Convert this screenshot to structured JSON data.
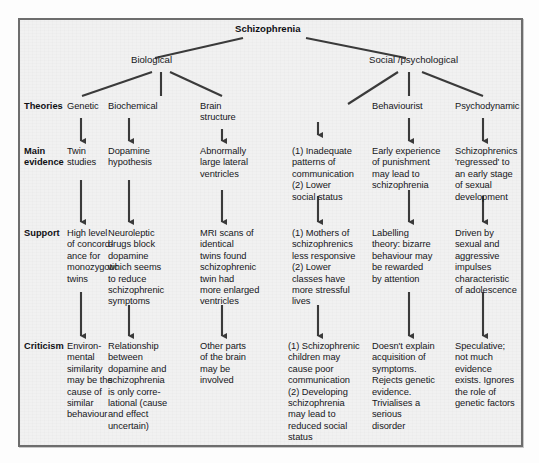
{
  "figure": {
    "root": "Schizophrenia",
    "branches": [
      {
        "id": "biological",
        "label": "Biological"
      },
      {
        "id": "social",
        "label": "Social /psychological"
      }
    ],
    "row_labels": [
      {
        "id": "theories",
        "label": "Theories"
      },
      {
        "id": "main-evidence",
        "label": "Main\nevidence"
      },
      {
        "id": "support",
        "label": "Support"
      },
      {
        "id": "criticism",
        "label": "Criticism"
      }
    ],
    "columns": [
      {
        "id": "genetic",
        "parent": "biological",
        "theory": "Genetic",
        "main_evidence": "Twin\nstudies",
        "support": "High level\nof concord-\nance for\nmonozygotic\ntwins",
        "criticism": "Environ-\nmental\nsimilarity\nmay be the\ncause of\nsimilar\nbehaviour"
      },
      {
        "id": "biochemical",
        "parent": "biological",
        "theory": "Biochemical",
        "main_evidence": "Dopamine\nhypothesis",
        "support": "Neuroleptic\ndrugs block\ndopamine\nwhich seems\nto reduce\nschizophrenic\nsymptoms",
        "criticism": "Relationship\nbetween\ndopamine and\nschizophrenia\nis only corre-\nlational (cause\nand effect\nuncertain)"
      },
      {
        "id": "brain-structure",
        "parent": "biological",
        "theory": "Brain\nstructure",
        "main_evidence": "Abnormally\nlarge lateral\nventricles",
        "support": "MRI scans of\nidentical\ntwins found\nschizophrenic\ntwin had\nmore enlarged\nventricles",
        "criticism": "Other parts\nof the brain\nmay be\ninvolved"
      },
      {
        "id": "communication",
        "parent": "social",
        "theory": "",
        "main_evidence": "(1) Inadequate\npatterns of\ncommunication\n(2) Lower\nsocial status",
        "support": "(1) Mothers of\nschizophrenics\nless responsive\n(2) Lower\nclasses have\nmore stressful\nlives",
        "criticism": "(1) Schizophrenic\nchildren may\ncause poor\ncommunication\n(2) Developing\nschizophrenia\nmay lead to\nreduced social\nstatus"
      },
      {
        "id": "behaviourist",
        "parent": "social",
        "theory": "Behaviourist",
        "main_evidence": "Early experience\nof punishment\nmay lead to\nschizophrenia",
        "support": "Labelling\ntheory: bizarre\nbehaviour may\nbe rewarded\nby attention",
        "criticism": "Doesn't explain\nacquisition of\nsymptoms.\nRejects genetic\nevidence.\nTrivialises a\nserious\ndisorder"
      },
      {
        "id": "psychodynamic",
        "parent": "social",
        "theory": "Psychodynamic",
        "main_evidence": "Schizophrenics\n'regressed' to\nan early stage\nof sexual\ndevelopment",
        "support": "Driven by\nsexual and\naggressive\nimpulses\ncharacteristic\nof adolescence",
        "criticism": "Speculative;\nnot much\nevidence\nexists. Ignores\nthe role of\ngenetic factors"
      }
    ],
    "colors": {
      "panel_background": "#f1f1f1",
      "panel_border": "#6d6d6d",
      "text": "#16161a",
      "connector": "#3a3a3a"
    }
  }
}
